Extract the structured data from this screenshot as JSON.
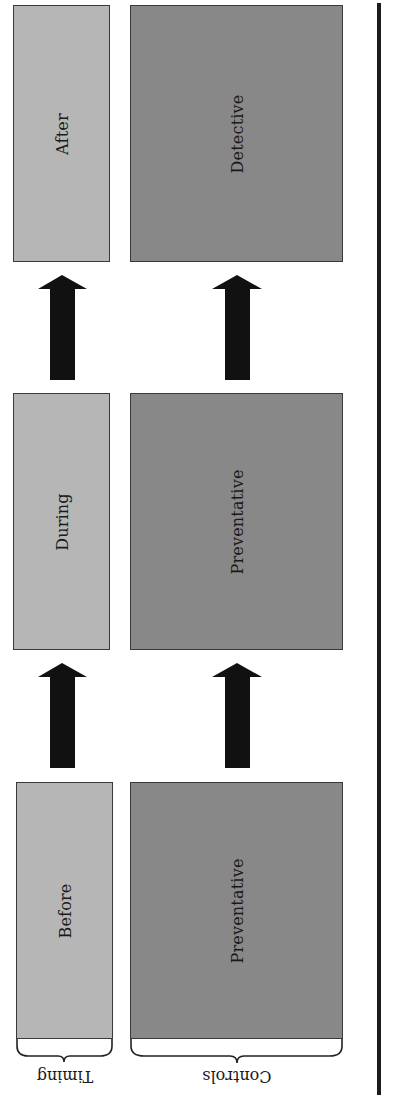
{
  "diagram": {
    "orientation_note": "Rotated 90 degrees; flow runs bottom to top",
    "colors": {
      "timing_fill": "#b6b6b6",
      "controls_fill": "#888888",
      "arrow": "#111111",
      "divider": "#1c1c1c"
    },
    "group_labels": {
      "timing": "Timing",
      "controls": "Controls"
    },
    "stages": [
      {
        "timing": "Before",
        "control": "Preventative"
      },
      {
        "timing": "During",
        "control": "Preventative"
      },
      {
        "timing": "After",
        "control": "Detective"
      }
    ],
    "arrows": [
      {
        "from": "Before",
        "to": "During"
      },
      {
        "from": "During",
        "to": "After"
      },
      {
        "from": "Preventative",
        "to": "Preventative"
      },
      {
        "from": "Preventative",
        "to": "Detective"
      }
    ]
  }
}
